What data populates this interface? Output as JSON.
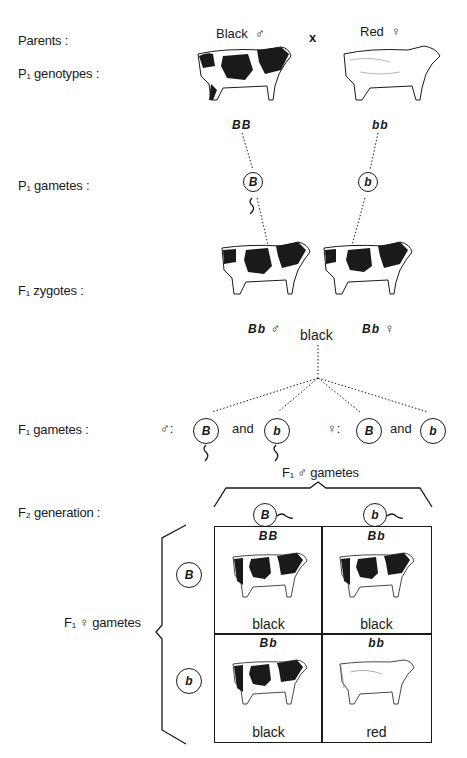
{
  "rows": {
    "parents": "Parents :",
    "p1_genotypes": "P₁  genotypes :",
    "p1_gametes": "P₁  gametes :",
    "f1_zygotes": "F₁  zygotes :",
    "f1_gametes": "F₁  gametes :",
    "f2_generation": "F₂  generation :"
  },
  "parents": {
    "male": {
      "label": "Black",
      "sex_symbol": "♂",
      "genotype": "BB",
      "gamete": "B",
      "coat": "black"
    },
    "cross_symbol": "x",
    "female": {
      "label": "Red",
      "sex_symbol": "♀",
      "genotype": "bb",
      "gamete": "b",
      "coat": "red"
    }
  },
  "f1": {
    "male": {
      "genotype": "Bb",
      "sex_symbol": "♂"
    },
    "female": {
      "genotype": "Bb",
      "sex_symbol": "♀"
    },
    "phenotype": "black",
    "gametes": {
      "male_symbol": "♂:",
      "female_symbol": "♀:",
      "and": "and",
      "male": [
        "B",
        "b"
      ],
      "female": [
        "B",
        "b"
      ]
    }
  },
  "punnett": {
    "column_header": "F₁ ♂ gametes",
    "row_header": "F₁ ♀ gametes",
    "columns": [
      "B",
      "b"
    ],
    "rows": [
      "B",
      "b"
    ],
    "cells": [
      [
        {
          "genotype": "BB",
          "phenotype": "black"
        },
        {
          "genotype": "Bb",
          "phenotype": "black"
        }
      ],
      [
        {
          "genotype": "Bb",
          "phenotype": "black"
        },
        {
          "genotype": "bb",
          "phenotype": "red"
        }
      ]
    ]
  },
  "colors": {
    "ink": "#1a1a1a",
    "background": "#ffffff"
  }
}
